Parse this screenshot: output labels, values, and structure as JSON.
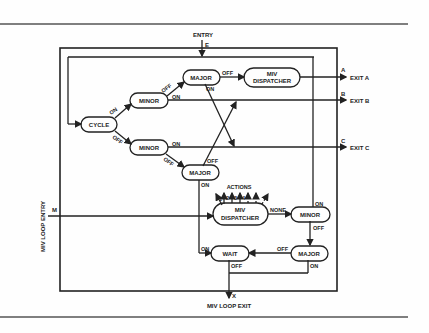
{
  "diagram": {
    "entry": {
      "label": "ENTRY",
      "marker": "E"
    },
    "loop_entry": {
      "label": "MIV LOOP ENTRY",
      "marker": "M"
    },
    "loop_exit": {
      "label": "MIV LOOP EXIT",
      "marker": "X"
    },
    "nodes": {
      "cycle": "CYCLE",
      "minor_top": "MINOR",
      "minor_bottom": "MINOR",
      "major_top": "MAJOR",
      "major_mid": "MAJOR",
      "dispatcher_top_l1": "MIV",
      "dispatcher_top_l2": "DISPATCHER",
      "dispatcher_bot_l1": "MIV",
      "dispatcher_bot_l2": "DISPATCHER",
      "minor_right": "MINOR",
      "major_right": "MAJOR",
      "wait": "WAIT"
    },
    "exits": [
      {
        "marker": "A",
        "label": "EXIT A"
      },
      {
        "marker": "B",
        "label": "EXIT B"
      },
      {
        "marker": "C",
        "label": "EXIT C"
      }
    ],
    "edge_labels": {
      "on": "ON",
      "off": "OFF",
      "none": "NONE"
    },
    "actions": {
      "label": "ACTIONS",
      "numbers": [
        "1",
        "2",
        "3",
        "4"
      ]
    },
    "colors": {
      "ink": "#222222",
      "background": "#fefefe"
    }
  }
}
